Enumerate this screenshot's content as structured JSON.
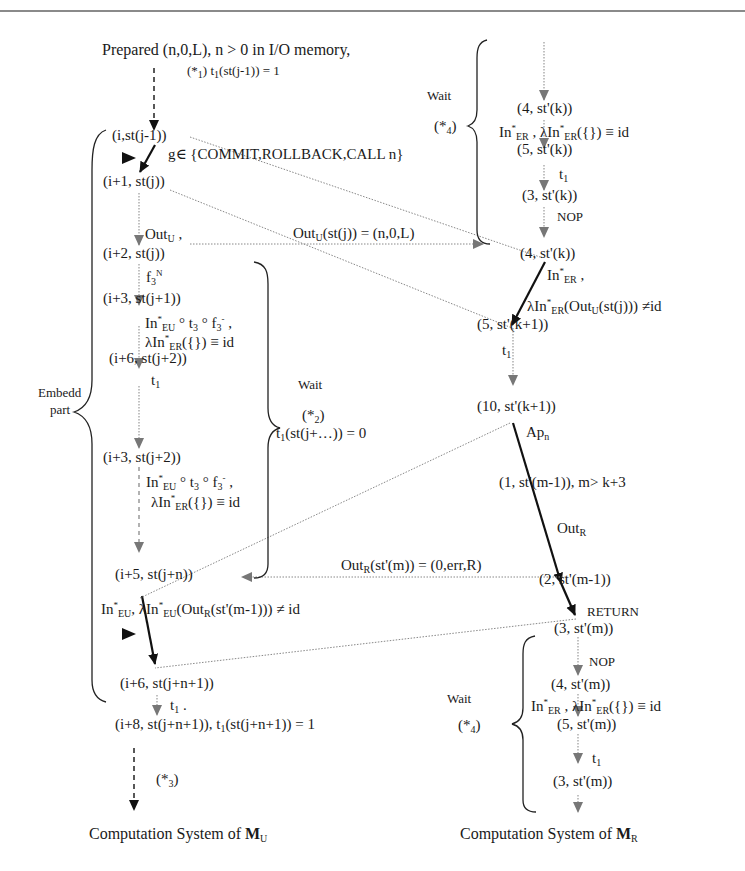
{
  "diagram": {
    "header_line": true,
    "top": {
      "prepared": "Prepared  (n,0,L), n > 0 in I/O memory,",
      "star1": "(*",
      "star1_sub": "1",
      "star1_tail": ")  t",
      "star1_t_sub": "1",
      "star1_expr": "(st(j-1)) = 1"
    },
    "left": {
      "nodes": [
        "(i,st(j-1))",
        "(i+1, st(j))",
        "(i+2, st(j))",
        "(i+3, st(j+1))",
        "(i+6, st(j+2))",
        "(i+3, st(j+2))",
        "(i+5,  st(j+n))",
        "(i+6, st(j+n+1))",
        "(i+8, st(j+n+1)),  t",
        "(st(j+n+1)) = 1"
      ],
      "labels": {
        "g_set": "g∈ {COMMIT,ROLLBACK,CALL n}",
        "out_u": "Out",
        "out_u_sub": "U",
        "f3": "f",
        "f3_sub": "3",
        "f3_sup": "N",
        "in_eu_a": "In",
        "in_eu_sup": "*",
        "in_eu_sub": "EU",
        "in_eu_rest": " ° t",
        "t3_sub": "3",
        "f3m": " ° f",
        "f3m_sub": "3",
        "f3m_sup": "-",
        "comma": " ,",
        "lambda": "λIn",
        "lambda_sup": "*",
        "lambda_sub": "ER",
        "lambda_rest": "({}) ≡ id",
        "t1": "t",
        "t1_sub": "1",
        "last_in_eu": "In",
        "last_in_eu_sub": "EU",
        "last_lambda": ", λIn",
        "last_lambda_sub": "EU",
        "last_lambda_rest": "(Out",
        "last_lambda_r": "R",
        "last_lambda_end": "(st'(m-1)))    ≠ id",
        "t1_bottom": "t",
        "t1_bottom_sub": "1",
        "star3": "(*",
        "star3_sub": "3",
        "star3_end": ")",
        "embedd": "Embedd",
        "part": "part",
        "wait": "Wait",
        "star2": "(*",
        "star2_sub": "2",
        "star2_end": ")",
        "t1_zero": "t",
        "t1_zero_sub": "1",
        "t1_zero_rest": "(st(j+…)) = 0"
      },
      "footer": "Computation System of ",
      "footer_m": "M",
      "footer_sub": "U"
    },
    "right": {
      "nodes": [
        "(4, st'(k))",
        "(5, st'(k))",
        "(3, st'(k))",
        "(4, st'(k))",
        "(5, st'(k+1))",
        "(10, st'(k+1))",
        "(1, st'(m-1)), m> k+3",
        "(2,  st'(m-1))",
        "(3, st'(m))",
        "(4, st'(m))",
        "(5, st'(m))",
        "(3, st'(m))"
      ],
      "labels": {
        "wait": "Wait",
        "star4": "(*",
        "star4_sub": "4",
        "star4_end": ")",
        "in_er": "In",
        "in_er_sub": "ER",
        "lambda_er": "λIn",
        "lambda_er_sub": "ER",
        "lambda_er_rest": "({}) ≡ id",
        "t1": "t",
        "t1_sub": "1",
        "nop": "NOP",
        "lambda_out": "λIn",
        "lambda_out_sub": "ER",
        "lambda_out_rest": "(Out",
        "lambda_out_u": "U",
        "lambda_out_end": "(st(j))) ≠id",
        "ap": "Ap",
        "ap_sub": "n",
        "out_r": "Out",
        "out_r_sub": "R",
        "return": "RETURN"
      },
      "footer": "Computation System of ",
      "footer_m": "M",
      "footer_sub": "R"
    },
    "cross": {
      "out_u_eq": "Out",
      "out_u_eq_sub": "U",
      "out_u_eq_rest": "(st(j))  = (n,0,L)",
      "out_r_eq": "Out",
      "out_r_eq_sub": "R",
      "out_r_eq_rest": "(st'(m)) = (0,err,R)"
    }
  }
}
